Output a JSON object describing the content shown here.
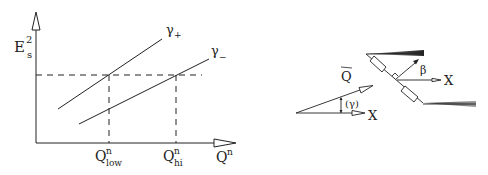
{
  "left_plot": {
    "y_axis": {
      "label_main": "E",
      "label_sup": "2",
      "label_sub": "s"
    },
    "x_axis": {
      "label_main": "Q",
      "label_sup": "n"
    },
    "curves": [
      {
        "name": "gamma-plus",
        "label_main": "γ",
        "label_sub": "+"
      },
      {
        "name": "gamma-minus",
        "label_main": "γ",
        "label_sub": "−"
      }
    ],
    "markers": [
      {
        "label_main": "Q",
        "label_sup": "n",
        "label_sub": "low"
      },
      {
        "label_main": "Q",
        "label_sup": "n",
        "label_sub": "hi"
      }
    ]
  },
  "right_diagram": {
    "vector_label": "Q",
    "angle_label": "(γ)",
    "x_label_lower": "X",
    "beta_label": "β",
    "x_label_upper": "X"
  },
  "colors": {
    "ink": "#222222",
    "background": "#ffffff"
  }
}
